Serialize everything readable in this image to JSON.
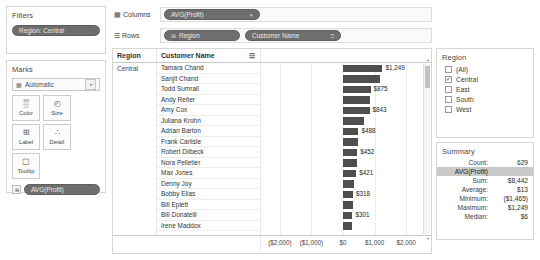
{
  "filters": {
    "title": "Filters",
    "pills": [
      {
        "label": "Region: Central"
      }
    ]
  },
  "marks": {
    "title": "Marks",
    "mark_type": "Automatic",
    "mark_type_icon": "bar-chart-icon",
    "dropdown_caret": "▾",
    "buttons": [
      {
        "label": "Color",
        "icon": "color-palette-icon",
        "glyph": "▒"
      },
      {
        "label": "Size",
        "icon": "size-icon",
        "glyph": "◴"
      },
      {
        "label": "Label",
        "icon": "label-icon",
        "glyph": "⊞"
      },
      {
        "label": "Detail",
        "icon": "detail-icon",
        "glyph": "∴"
      },
      {
        "label": "Tooltip",
        "icon": "tooltip-icon",
        "glyph": "▢"
      }
    ],
    "measure_pill": {
      "label": "AVG(Profit)",
      "chip_glyph": "⊞"
    }
  },
  "shelves": {
    "columns": {
      "label": "Columns",
      "icon": "columns-icon",
      "pills": [
        {
          "label": "AVG(Profit)",
          "caret": "▾"
        }
      ]
    },
    "rows": {
      "label": "Rows",
      "icon": "rows-icon",
      "pills": [
        {
          "label": "Region",
          "icon": "⊞",
          "caret": ""
        },
        {
          "label": "Customer Name",
          "icon": "",
          "caret": "☲"
        }
      ]
    }
  },
  "table": {
    "headers": {
      "region": "Region",
      "customer": "Customer Name",
      "sort_icon": "sort-descending-icon",
      "sort_glyph": "☲"
    },
    "region_value": "Central",
    "rows": [
      {
        "name": "Tamara Chand",
        "value": 1249,
        "label": "$1,249",
        "show_label": true
      },
      {
        "name": "Sanjit Chand",
        "value": 1168,
        "label": "$1,168",
        "show_label": false
      },
      {
        "name": "Todd Sumrall",
        "value": 875,
        "label": "$875",
        "show_label": true
      },
      {
        "name": "Andy Reiter",
        "value": 862,
        "label": "$862",
        "show_label": false
      },
      {
        "name": "Amy Cox",
        "value": 843,
        "label": "$843",
        "show_label": true
      },
      {
        "name": "Juliana Krohn",
        "value": 660,
        "label": "$660",
        "show_label": false
      },
      {
        "name": "Adrian Barton",
        "value": 488,
        "label": "$488",
        "show_label": true
      },
      {
        "name": "Frank Carlisle",
        "value": 470,
        "label": "$470",
        "show_label": false
      },
      {
        "name": "Robert Dilbeck",
        "value": 452,
        "label": "$452",
        "show_label": true
      },
      {
        "name": "Nora Pelletier",
        "value": 430,
        "label": "$430",
        "show_label": false
      },
      {
        "name": "Max Jones",
        "value": 421,
        "label": "$421",
        "show_label": true
      },
      {
        "name": "Denny Joy",
        "value": 360,
        "label": "$360",
        "show_label": false
      },
      {
        "name": "Bobby Elias",
        "value": 318,
        "label": "$318",
        "show_label": true
      },
      {
        "name": "Bill Eplett",
        "value": 310,
        "label": "$310",
        "show_label": false
      },
      {
        "name": "Bill Donatelli",
        "value": 301,
        "label": "$301",
        "show_label": true
      },
      {
        "name": "Irene Maddox",
        "value": 290,
        "label": "$290",
        "show_label": false
      }
    ]
  },
  "chart_data": {
    "type": "bar",
    "title": "",
    "xlabel": "",
    "ylabel": "",
    "orientation": "horizontal",
    "categories": [
      "Tamara Chand",
      "Sanjit Chand",
      "Todd Sumrall",
      "Andy Reiter",
      "Amy Cox",
      "Juliana Krohn",
      "Adrian Barton",
      "Frank Carlisle",
      "Robert Dilbeck",
      "Nora Pelletier",
      "Max Jones",
      "Denny Joy",
      "Bobby Elias",
      "Bill Eplett",
      "Bill Donatelli",
      "Irene Maddox"
    ],
    "values": [
      1249,
      1168,
      875,
      862,
      843,
      660,
      488,
      470,
      452,
      430,
      421,
      360,
      318,
      310,
      301,
      290
    ],
    "measure": "AVG(Profit)",
    "xlim": [
      -2600,
      2600
    ],
    "ticks": [
      -2000,
      -1000,
      0,
      1000,
      2000
    ],
    "tick_labels": [
      "($2,000)",
      "($1,000)",
      "$0",
      "$1,000",
      "$2,000"
    ],
    "grid": true,
    "bar_color": "#4e4e4e",
    "legend": "none"
  },
  "region_legend": {
    "title": "Region",
    "items": [
      {
        "label": "(All)",
        "checked": false
      },
      {
        "label": "Central",
        "checked": true
      },
      {
        "label": "East",
        "checked": false
      },
      {
        "label": "South",
        "checked": false
      },
      {
        "label": "West",
        "checked": false
      }
    ],
    "check_glyph": "✓"
  },
  "summary": {
    "title": "Summary",
    "rows": [
      {
        "key": "Count:",
        "value": "629",
        "highlight": false
      },
      {
        "key": "AVG(Profit)",
        "value": "",
        "highlight": true
      },
      {
        "key": "Sum:",
        "value": "$8,442",
        "highlight": false
      },
      {
        "key": "Average:",
        "value": "$13",
        "highlight": false
      },
      {
        "key": "Minimum:",
        "value": "($1,465)",
        "highlight": false
      },
      {
        "key": "Maximum:",
        "value": "$1,249",
        "highlight": false
      },
      {
        "key": "Median:",
        "value": "$6",
        "highlight": false
      }
    ]
  },
  "scrollbar": {
    "up_glyph": "▴",
    "down_glyph": "▾"
  }
}
